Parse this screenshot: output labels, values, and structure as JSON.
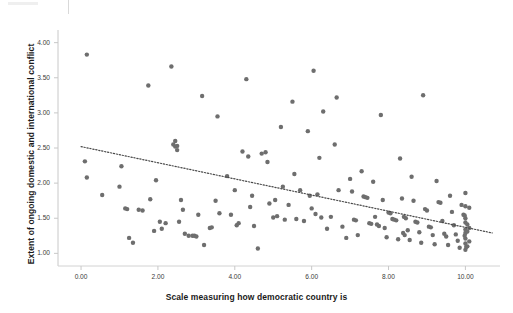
{
  "figure": {
    "background_color": "#ffffff",
    "point_color": "#6e6e6e",
    "axis_color": "#c8c8c8",
    "trend_color": "#4a4a4a"
  },
  "chart_data": {
    "type": "scatter",
    "title": "",
    "xlabel": "Scale measuring how democratic country is",
    "ylabel": "Extent of ongoing domestic and international conflict",
    "xlim": [
      -0.6,
      10.9
    ],
    "ylim": [
      0.82,
      4.18
    ],
    "xticks": [
      0,
      2,
      4,
      6,
      8,
      10
    ],
    "xtick_labels": [
      "0.00",
      "2.00",
      "4.00",
      "6.00",
      "8.00",
      "10.00"
    ],
    "yticks": [
      1.0,
      1.5,
      2.0,
      2.5,
      3.0,
      3.5,
      4.0
    ],
    "ytick_labels": [
      "1.00",
      "1.50",
      "2.00",
      "2.50",
      "3.00",
      "3.50",
      "4.00"
    ],
    "grid": false,
    "legend": null,
    "marker_size": 3.2,
    "trendline": {
      "type": "linear-dotted",
      "x_start": 0.0,
      "y_start": 2.52,
      "x_end": 10.7,
      "y_end": 1.29,
      "slope": -0.115,
      "intercept": 2.52
    },
    "points": [
      [
        0.15,
        3.83
      ],
      [
        0.1,
        2.31
      ],
      [
        0.15,
        2.08
      ],
      [
        0.55,
        1.83
      ],
      [
        1.0,
        1.95
      ],
      [
        1.05,
        2.24
      ],
      [
        1.15,
        1.64
      ],
      [
        1.2,
        1.63
      ],
      [
        1.25,
        1.22
      ],
      [
        1.35,
        1.15
      ],
      [
        1.5,
        1.62
      ],
      [
        1.6,
        1.61
      ],
      [
        1.75,
        3.39
      ],
      [
        1.8,
        1.77
      ],
      [
        1.9,
        1.32
      ],
      [
        1.95,
        2.04
      ],
      [
        2.05,
        1.45
      ],
      [
        2.1,
        1.35
      ],
      [
        2.2,
        1.43
      ],
      [
        2.35,
        3.66
      ],
      [
        2.4,
        2.55
      ],
      [
        2.45,
        2.52
      ],
      [
        2.5,
        2.53
      ],
      [
        2.55,
        1.45
      ],
      [
        2.6,
        1.76
      ],
      [
        2.65,
        1.62
      ],
      [
        2.7,
        1.28
      ],
      [
        2.8,
        1.25
      ],
      [
        2.9,
        1.25
      ],
      [
        2.95,
        1.25
      ],
      [
        3.0,
        1.24
      ],
      [
        3.05,
        1.55
      ],
      [
        3.15,
        3.24
      ],
      [
        3.2,
        1.12
      ],
      [
        3.35,
        1.36
      ],
      [
        3.4,
        1.37
      ],
      [
        3.5,
        1.75
      ],
      [
        3.55,
        2.95
      ],
      [
        3.6,
        1.57
      ],
      [
        3.8,
        2.1
      ],
      [
        3.9,
        1.55
      ],
      [
        4.0,
        1.9
      ],
      [
        4.05,
        1.4
      ],
      [
        4.1,
        1.43
      ],
      [
        4.2,
        2.45
      ],
      [
        4.3,
        3.48
      ],
      [
        4.35,
        2.38
      ],
      [
        4.4,
        1.66
      ],
      [
        4.5,
        1.39
      ],
      [
        4.6,
        1.07
      ],
      [
        4.7,
        2.42
      ],
      [
        4.8,
        2.44
      ],
      [
        4.85,
        2.3
      ],
      [
        4.9,
        1.71
      ],
      [
        5.0,
        1.51
      ],
      [
        5.05,
        1.76
      ],
      [
        5.1,
        1.53
      ],
      [
        5.2,
        2.8
      ],
      [
        5.25,
        1.95
      ],
      [
        5.3,
        1.48
      ],
      [
        5.4,
        1.69
      ],
      [
        5.5,
        3.16
      ],
      [
        5.55,
        2.13
      ],
      [
        5.6,
        1.49
      ],
      [
        5.7,
        1.9
      ],
      [
        5.8,
        1.46
      ],
      [
        5.9,
        2.74
      ],
      [
        6.0,
        1.64
      ],
      [
        6.05,
        3.6
      ],
      [
        6.1,
        1.56
      ],
      [
        6.2,
        2.36
      ],
      [
        6.25,
        1.51
      ],
      [
        6.3,
        3.02
      ],
      [
        6.4,
        1.35
      ],
      [
        6.5,
        1.52
      ],
      [
        6.6,
        2.55
      ],
      [
        6.65,
        3.22
      ],
      [
        6.7,
        1.9
      ],
      [
        6.8,
        1.38
      ],
      [
        6.9,
        1.22
      ],
      [
        7.0,
        2.06
      ],
      [
        7.05,
        1.88
      ],
      [
        7.1,
        1.48
      ],
      [
        7.15,
        1.47
      ],
      [
        7.2,
        1.26
      ],
      [
        7.3,
        2.17
      ],
      [
        7.35,
        1.81
      ],
      [
        7.4,
        1.8
      ],
      [
        7.45,
        1.79
      ],
      [
        7.5,
        1.43
      ],
      [
        7.55,
        1.42
      ],
      [
        7.6,
        2.02
      ],
      [
        7.65,
        1.52
      ],
      [
        7.7,
        1.41
      ],
      [
        7.75,
        1.39
      ],
      [
        7.8,
        2.97
      ],
      [
        7.85,
        1.76
      ],
      [
        7.9,
        1.36
      ],
      [
        7.95,
        1.23
      ],
      [
        8.0,
        1.58
      ],
      [
        8.05,
        1.57
      ],
      [
        8.1,
        1.49
      ],
      [
        8.15,
        1.48
      ],
      [
        8.2,
        1.47
      ],
      [
        8.25,
        1.2
      ],
      [
        8.3,
        2.35
      ],
      [
        8.35,
        1.78
      ],
      [
        8.4,
        1.52
      ],
      [
        8.45,
        1.5
      ],
      [
        8.5,
        1.33
      ],
      [
        8.55,
        1.19
      ],
      [
        8.6,
        2.09
      ],
      [
        8.65,
        1.75
      ],
      [
        8.7,
        1.45
      ],
      [
        8.75,
        1.44
      ],
      [
        8.8,
        1.3
      ],
      [
        8.85,
        1.15
      ],
      [
        8.9,
        3.25
      ],
      [
        8.95,
        1.63
      ],
      [
        9.0,
        1.61
      ],
      [
        9.05,
        1.38
      ],
      [
        9.1,
        1.37
      ],
      [
        9.15,
        1.26
      ],
      [
        9.2,
        1.13
      ],
      [
        9.25,
        2.03
      ],
      [
        9.3,
        1.73
      ],
      [
        9.35,
        1.72
      ],
      [
        9.4,
        1.46
      ],
      [
        9.45,
        1.28
      ],
      [
        9.5,
        1.24
      ],
      [
        9.55,
        1.12
      ],
      [
        9.6,
        1.82
      ],
      [
        9.65,
        1.59
      ],
      [
        9.7,
        1.4
      ],
      [
        9.75,
        1.27
      ],
      [
        9.8,
        1.18
      ],
      [
        9.85,
        1.08
      ],
      [
        9.9,
        1.69
      ],
      [
        9.95,
        1.55
      ],
      [
        10.0,
        1.86
      ],
      [
        10.0,
        1.67
      ],
      [
        10.0,
        1.5
      ],
      [
        10.0,
        1.44
      ],
      [
        10.0,
        1.34
      ],
      [
        10.0,
        1.29
      ],
      [
        10.0,
        1.21
      ],
      [
        10.0,
        1.14
      ],
      [
        10.0,
        1.05
      ],
      [
        10.05,
        1.41
      ],
      [
        10.05,
        1.31
      ],
      [
        10.05,
        1.1
      ],
      [
        10.1,
        1.65
      ],
      [
        10.1,
        1.36
      ],
      [
        10.1,
        1.17
      ],
      [
        2.45,
        2.6
      ],
      [
        2.5,
        2.47
      ],
      [
        5.95,
        1.82
      ],
      [
        6.15,
        1.84
      ],
      [
        4.45,
        1.82
      ],
      [
        9.98,
        1.54
      ],
      [
        9.98,
        1.25
      ],
      [
        10.02,
        1.09
      ],
      [
        8.38,
        1.29
      ],
      [
        8.42,
        1.26
      ]
    ]
  }
}
